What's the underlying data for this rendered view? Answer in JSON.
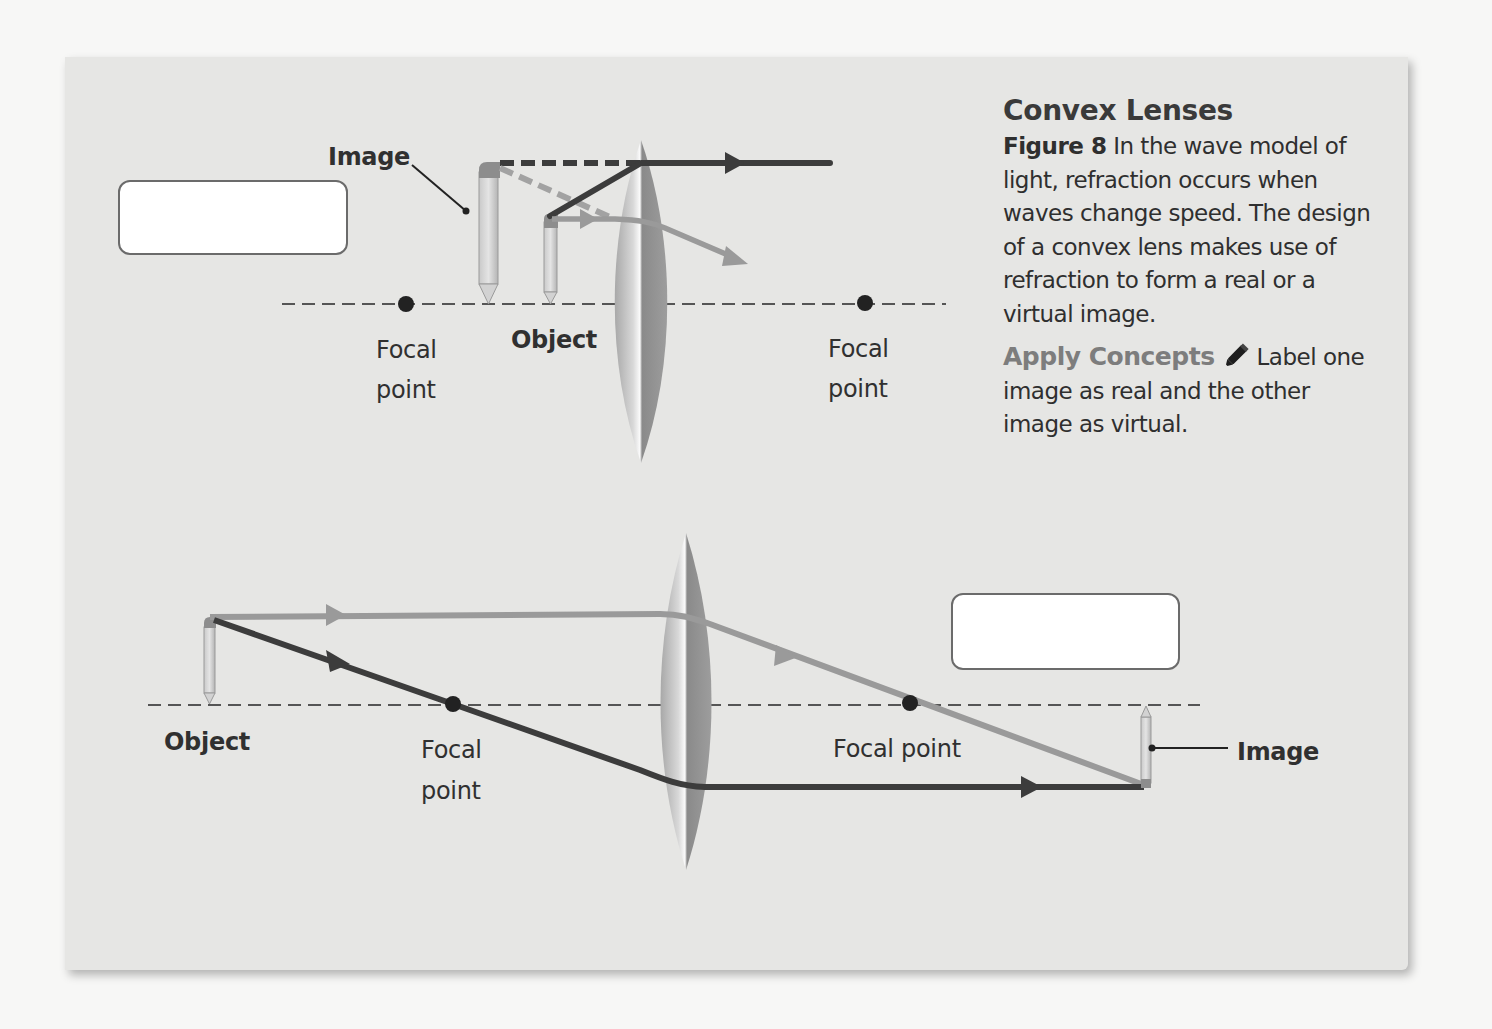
{
  "caption": {
    "title": "Convex Lenses",
    "figure_label": "Figure 8",
    "figure_text": " In the wave model of light, refraction occurs when waves change speed. The design of a convex lens makes use of refraction to form a real or a virtual image.",
    "apply_label": "Apply Concepts",
    "apply_icon": "marker-icon",
    "apply_text": "Label one image as real and the other image as virtual."
  },
  "diagram_top": {
    "description": "Object inside focal length: virtual, upright, enlarged image",
    "labels": {
      "image": "Image",
      "object": "Object",
      "focal_left_1": "Focal",
      "focal_left_2": "point",
      "focal_right_1": "Focal",
      "focal_right_2": "point"
    },
    "answer_box": {
      "value": ""
    }
  },
  "diagram_bottom": {
    "description": "Object beyond focal length: real, inverted image",
    "labels": {
      "object": "Object",
      "focal_left_1": "Focal",
      "focal_left_2": "point",
      "focal_right": "Focal point",
      "image": "Image"
    },
    "answer_box": {
      "value": ""
    }
  },
  "colors": {
    "panel": "#e6e6e4",
    "ray_dark": "#3c3c3c",
    "ray_light": "#9a9a9a",
    "axis": "#555555",
    "answer_box_border": "#6b6b6b"
  }
}
